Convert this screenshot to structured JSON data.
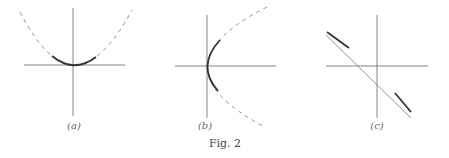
{
  "figure": {
    "caption": "Fig. 2",
    "panels": [
      {
        "label": "(a)",
        "description": "parabola opening upward, solid near vertex, dashed elsewhere"
      },
      {
        "label": "(b)",
        "description": "parabola opening rightward, solid near vertex, dashed elsewhere"
      },
      {
        "label": "(c)",
        "description": "straight line with negative slope, thick segments at ends"
      }
    ]
  },
  "colors": {
    "axis": "#555555",
    "curve": "#333333",
    "dashed": "#777777"
  }
}
